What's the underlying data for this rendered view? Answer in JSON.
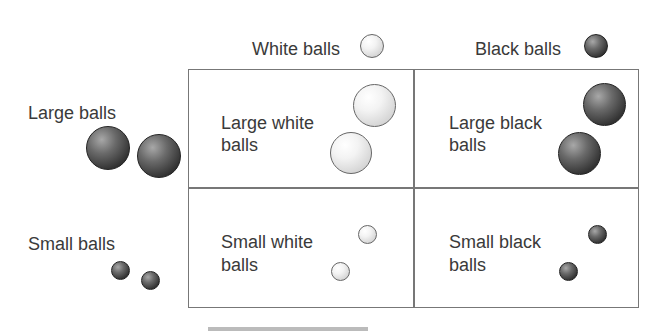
{
  "columns": {
    "white_label": "White balls",
    "black_label": "Black balls"
  },
  "rows": {
    "large_label": "Large balls",
    "small_label": "Small balls"
  },
  "cells": {
    "large_white": [
      "Large white",
      "balls"
    ],
    "large_black": [
      "Large black",
      "balls"
    ],
    "small_white": [
      "Small white",
      "balls"
    ],
    "small_black": [
      "Small black",
      "balls"
    ]
  },
  "colors": {
    "border": "#777777",
    "text": "#3a3a3a"
  }
}
